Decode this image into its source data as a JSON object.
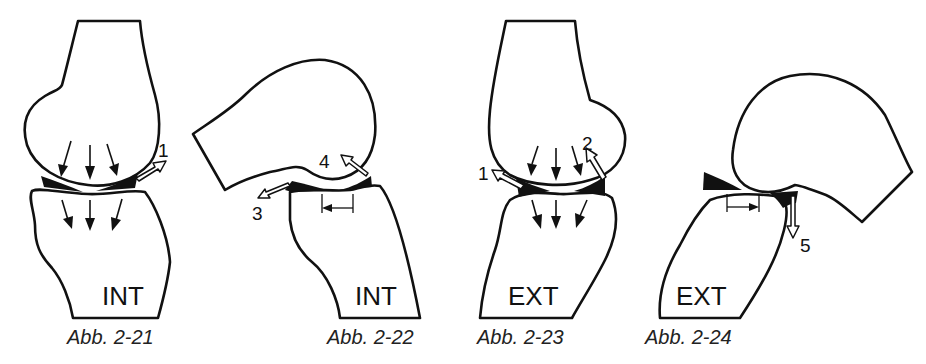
{
  "figure": {
    "panels": [
      {
        "id": "abb-2-21",
        "caption": "Abb. 2-21",
        "compartment": "INT",
        "labels": [
          "1"
        ]
      },
      {
        "id": "abb-2-22",
        "caption": "Abb. 2-22",
        "compartment": "INT",
        "labels": [
          "3",
          "4"
        ]
      },
      {
        "id": "abb-2-23",
        "caption": "Abb. 2-23",
        "compartment": "EXT",
        "labels": [
          "1",
          "2"
        ]
      },
      {
        "id": "abb-2-24",
        "caption": "Abb. 2-24",
        "compartment": "EXT",
        "labels": [
          "5"
        ]
      }
    ]
  }
}
